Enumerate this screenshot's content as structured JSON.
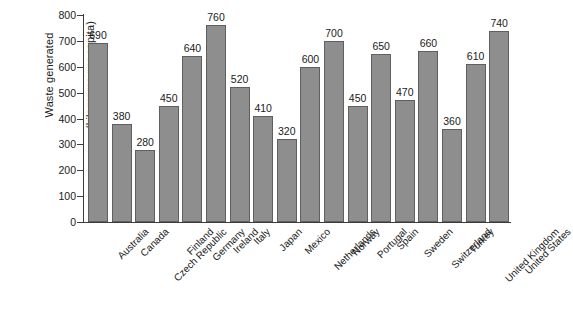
{
  "chart_data": {
    "type": "bar",
    "title": "",
    "subtitle": "",
    "xlabel": "",
    "ylabel": "Waste generated (kilograms per capita)",
    "ylabel_lines": [
      "Waste generated",
      "(kilograms per capita)"
    ],
    "ylim": [
      0,
      800
    ],
    "ytick_step": 100,
    "yticks": [
      800,
      700,
      600,
      500,
      400,
      300,
      200,
      100,
      0
    ],
    "grid": false,
    "legend": null,
    "bar_color": "#8e8e8e",
    "bar_edge_color": "#5f5f5f",
    "axis_color": "#3c3c3c",
    "background": "#ffffff",
    "value_labels_shown": true,
    "xtick_rotation_degrees": 45,
    "categories": [
      "Australia",
      "Canada",
      "Czech Republic",
      "Finland",
      "Germany",
      "Ireland",
      "Italy",
      "Japan",
      "Mexico",
      "Netherlands",
      "Norway",
      "Portugal",
      "Spain",
      "Sweden",
      "Switzerland",
      "Turkey",
      "United Kingdom",
      "United States"
    ],
    "values": [
      690,
      380,
      280,
      450,
      640,
      760,
      520,
      410,
      320,
      600,
      700,
      450,
      650,
      470,
      660,
      360,
      610,
      740
    ]
  }
}
